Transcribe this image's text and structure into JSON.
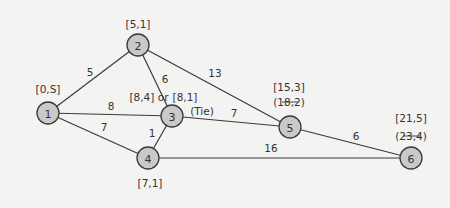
{
  "colors": {
    "background": "#f3f3f2",
    "node_fill": "#c9c9c9",
    "stroke": "#3a3a3a",
    "text": "#333333"
  },
  "nodes": [
    {
      "id": "1",
      "x": 48,
      "y": 113
    },
    {
      "id": "2",
      "x": 138,
      "y": 45
    },
    {
      "id": "3",
      "x": 172,
      "y": 116
    },
    {
      "id": "4",
      "x": 148,
      "y": 158
    },
    {
      "id": "5",
      "x": 290,
      "y": 127
    },
    {
      "id": "6",
      "x": 411,
      "y": 158
    }
  ],
  "edges": [
    {
      "from": "1",
      "to": "2",
      "weight": "5"
    },
    {
      "from": "1",
      "to": "3",
      "weight": "8"
    },
    {
      "from": "1",
      "to": "4",
      "weight": "7"
    },
    {
      "from": "2",
      "to": "3",
      "weight": "6"
    },
    {
      "from": "2",
      "to": "5",
      "weight": "13"
    },
    {
      "from": "3",
      "to": "4",
      "weight": "1"
    },
    {
      "from": "3",
      "to": "5",
      "weight": "7"
    },
    {
      "from": "4",
      "to": "6",
      "weight": "16"
    },
    {
      "from": "5",
      "to": "6",
      "weight": "6"
    }
  ],
  "labels": {
    "node1": "[0,S]",
    "node2": "[5,1]",
    "node3_a": "[8,4] or",
    "node3_b": "[8,1]",
    "node3_tie": "(Tie)",
    "node4": "[7,1]",
    "node5_final": "[15,3]",
    "node5_old": "(18,2)",
    "node6_final": "[21,5]",
    "node6_old": "(23,4)"
  }
}
